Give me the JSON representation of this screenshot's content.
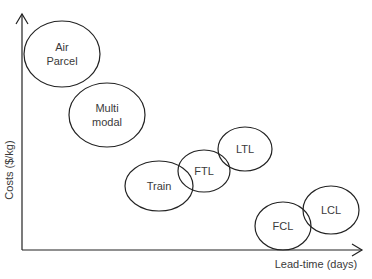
{
  "diagram": {
    "type": "positioning-map",
    "axes": {
      "y_label": "Costs ($/kg)",
      "x_label": "Lead-time (days)"
    },
    "colors": {
      "stroke": "#222222",
      "text": "#3a3a3a",
      "background": "#ffffff"
    },
    "modes": [
      {
        "id": "air-parcel",
        "lines": [
          "Air",
          "Parcel"
        ],
        "cx": 62,
        "cy": 54,
        "rx": 38,
        "ry": 33
      },
      {
        "id": "multimodal",
        "lines": [
          "Multi",
          "modal"
        ],
        "cx": 107,
        "cy": 115,
        "rx": 38,
        "ry": 32
      },
      {
        "id": "train",
        "lines": [
          "Train"
        ],
        "cx": 159,
        "cy": 186,
        "rx": 34,
        "ry": 25
      },
      {
        "id": "ftl",
        "lines": [
          "FTL"
        ],
        "cx": 204,
        "cy": 171,
        "rx": 26,
        "ry": 21
      },
      {
        "id": "ltl",
        "lines": [
          "LTL"
        ],
        "cx": 245,
        "cy": 149,
        "rx": 27,
        "ry": 22
      },
      {
        "id": "fcl",
        "lines": [
          "FCL"
        ],
        "cx": 283,
        "cy": 226,
        "rx": 28,
        "ry": 24
      },
      {
        "id": "lcl",
        "lines": [
          "LCL"
        ],
        "cx": 331,
        "cy": 210,
        "rx": 28,
        "ry": 24
      }
    ]
  }
}
